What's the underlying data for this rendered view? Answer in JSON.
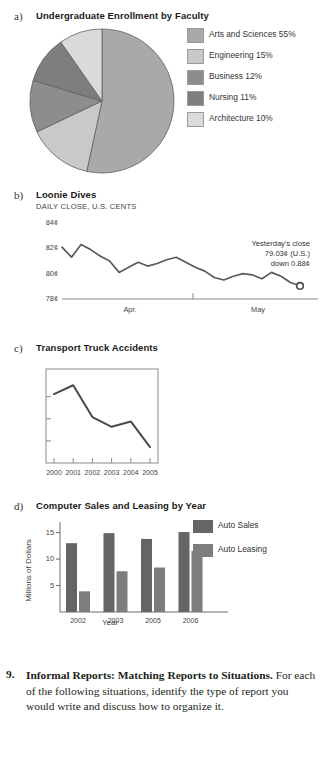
{
  "figures": {
    "a": {
      "letter": "a)",
      "title": "Undergraduate Enrollment by Faculty"
    },
    "b": {
      "letter": "b)",
      "title": "Loonie Dives",
      "subtitle": "DAILY CLOSE, U.S. CENTS",
      "annotation_line1": "Yesterday's close",
      "annotation_line2": "79.03¢ (U.S.)",
      "annotation_line3": "down 0.88¢"
    },
    "c": {
      "letter": "c)",
      "title": "Transport Truck Accidents"
    },
    "d": {
      "letter": "d)",
      "title": "Computer Sales and Leasing by Year"
    }
  },
  "chart_data": [
    {
      "id": "a",
      "type": "pie",
      "title": "Undergraduate Enrollment by Faculty",
      "legend_position": "right",
      "categories": [
        "Arts and Sciences",
        "Engineering",
        "Business",
        "Nursing",
        "Architecture"
      ],
      "values": [
        55,
        15,
        12,
        11,
        10
      ],
      "value_suffix": "%",
      "legend_labels": [
        "Arts and Sciences 55%",
        "Engineering 15%",
        "Business 12%",
        "Nursing 11%",
        "Architecture 10%"
      ],
      "colors": [
        "#a9a9a9",
        "#c9c9c9",
        "#8d8d8d",
        "#7e7e7e",
        "#dadada"
      ]
    },
    {
      "id": "b",
      "type": "line",
      "title": "Loonie Dives",
      "subtitle": "DAILY CLOSE, U.S. CENTS",
      "ylabel": "",
      "xlabel": "",
      "ylim": [
        78,
        84
      ],
      "ytick_labels": [
        "84¢",
        "82¢",
        "80¢",
        "78¢"
      ],
      "ytick_values": [
        84,
        82,
        80,
        78
      ],
      "xtick_labels": [
        "Apr.",
        "May"
      ],
      "grid": false,
      "values": [
        82.1,
        81.3,
        82.3,
        81.9,
        81.4,
        81.0,
        80.1,
        80.5,
        80.9,
        80.6,
        80.8,
        81.1,
        81.3,
        80.9,
        80.5,
        80.2,
        79.7,
        79.5,
        79.8,
        80.0,
        79.9,
        79.6,
        80.1,
        79.8,
        79.3,
        79.03
      ],
      "end_marker": true,
      "annotation": "Yesterday's close 79.03¢ (U.S.) down 0.88¢"
    },
    {
      "id": "c",
      "type": "line",
      "title": "Transport Truck Accidents",
      "xlabel": "",
      "ylabel": "",
      "grid": false,
      "categories": [
        "2000",
        "2001",
        "2002",
        "2003",
        "2004",
        "2005"
      ],
      "values": [
        78,
        88,
        52,
        41,
        47,
        18
      ],
      "ylim": [
        0,
        100
      ],
      "ytick_labels": [
        "",
        "",
        ""
      ]
    },
    {
      "id": "d",
      "type": "bar",
      "title": "Computer Sales and Leasing by Year",
      "xlabel": "Year",
      "ylabel": "Millions of Dollars",
      "ylim": [
        0,
        17
      ],
      "ytick_labels": [
        "5",
        "10",
        "15"
      ],
      "ytick_values": [
        5,
        10,
        15
      ],
      "categories": [
        "2002",
        "2003",
        "2005",
        "2006"
      ],
      "legend_position": "right",
      "series": [
        {
          "name": "Auto Sales",
          "values": [
            13.0,
            14.9,
            13.8,
            15.1
          ],
          "color": "#656565"
        },
        {
          "name": "Auto Leasing",
          "values": [
            3.9,
            7.7,
            8.4,
            11.5
          ],
          "color": "#7d7d7d"
        }
      ]
    }
  ],
  "paragraph": {
    "number": "9.",
    "bold_lead": "Informal Reports: Matching Reports to Situations.",
    "rest": " For each of the following situations, identify the type of report you would write and discuss how to organize it."
  }
}
